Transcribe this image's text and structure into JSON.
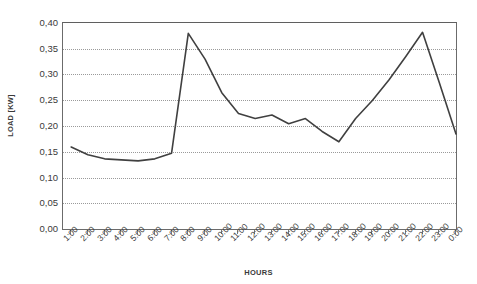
{
  "chart_data": {
    "type": "line",
    "title": "",
    "xlabel": "HOURS",
    "ylabel": "LOAD [KW]",
    "ylim": [
      0.0,
      0.4
    ],
    "ytick_labels": [
      "0,40",
      "0,35",
      "0,30",
      "0,25",
      "0,20",
      "0,15",
      "0,10",
      "0,05",
      "0,00"
    ],
    "ytick_values": [
      0.4,
      0.35,
      0.3,
      0.25,
      0.2,
      0.15,
      0.1,
      0.05,
      0.0
    ],
    "grid": "horizontal-dotted",
    "legend": "none",
    "series_color": "#404040",
    "categories": [
      "1:00",
      "2:00",
      "3:00",
      "4:00",
      "5:00",
      "6:00",
      "7:00",
      "8:00",
      "9:00",
      "10:00",
      "11:00",
      "12:00",
      "13:00",
      "14:00",
      "15:00",
      "16:00",
      "17:00",
      "18:00",
      "19:00",
      "20:00",
      "21:00",
      "22:00",
      "23:00",
      "0:00"
    ],
    "values": [
      0.16,
      0.145,
      0.137,
      0.135,
      0.133,
      0.137,
      0.148,
      0.38,
      0.33,
      0.265,
      0.225,
      0.215,
      0.222,
      0.205,
      0.215,
      0.19,
      0.17,
      0.215,
      0.25,
      0.29,
      0.335,
      0.382,
      0.285,
      0.185
    ]
  }
}
